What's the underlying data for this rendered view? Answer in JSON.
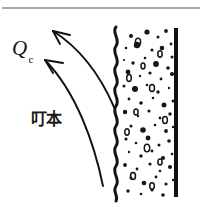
{
  "figure": {
    "background_color": "#ffffff",
    "ink_color": "#111111",
    "rule_color": "#8c8c8c",
    "width": 202,
    "height": 215,
    "top_rule": {
      "name": "top-horizontal-rule",
      "x1": 2,
      "y1": 8,
      "x2": 200,
      "y2": 8,
      "thickness": 1.6,
      "color": "#8c8c8c"
    },
    "labels": [
      {
        "name": "heat-flux-label",
        "base": "Q",
        "subscript": "c",
        "x": 12,
        "y": 36,
        "style": "italic-serif"
      },
      {
        "name": "material-annotation-label",
        "text": "叮本",
        "x": 31,
        "y": 104,
        "style": "bold-cjk"
      }
    ],
    "wall": {
      "name": "solid-wall-line",
      "x": 176,
      "y_top": 28,
      "y_bottom": 197,
      "thickness": 4,
      "color": "#111111"
    },
    "porous_boundary": {
      "name": "wavy-interface-line",
      "x_center": 116,
      "amplitude": 4.5,
      "wavelength": 20,
      "y_top": 27,
      "y_bottom": 201,
      "thickness": 3,
      "color": "#141414"
    },
    "arrows": [
      {
        "name": "upper-convection-arrow",
        "tail_x": 114,
        "tail_y": 107,
        "control_x": 100,
        "control_y": 66,
        "tip_x": 53,
        "tip_y": 31,
        "head_size": 13
      },
      {
        "name": "lower-convection-arrow",
        "tail_x": 103,
        "tail_y": 186,
        "control_x": 80,
        "control_y": 112,
        "tip_x": 45,
        "tip_y": 60,
        "head_size": 13
      }
    ],
    "speckles": {
      "name": "porous-material-speckles",
      "region": {
        "x_min": 122,
        "x_max": 174,
        "y_min": 30,
        "y_max": 198
      },
      "dots": [
        [
          131,
          36,
          2.0
        ],
        [
          147,
          32,
          2.6
        ],
        [
          158,
          37,
          1.5
        ],
        [
          166,
          31,
          1.9
        ],
        [
          171,
          44,
          1.4
        ],
        [
          126,
          48,
          1.3
        ],
        [
          137,
          45,
          3.2
        ],
        [
          152,
          50,
          1.6
        ],
        [
          162,
          48,
          2.3
        ],
        [
          172,
          57,
          1.5
        ],
        [
          124,
          60,
          1.1
        ],
        [
          133,
          63,
          1.7
        ],
        [
          145,
          58,
          1.3
        ],
        [
          156,
          64,
          2.9
        ],
        [
          168,
          68,
          1.8
        ],
        [
          128,
          72,
          2.4
        ],
        [
          140,
          76,
          1.2
        ],
        [
          150,
          73,
          1.6
        ],
        [
          161,
          79,
          1.4
        ],
        [
          172,
          74,
          2.1
        ],
        [
          124,
          86,
          1.5
        ],
        [
          135,
          89,
          3.0
        ],
        [
          147,
          85,
          1.3
        ],
        [
          158,
          92,
          1.7
        ],
        [
          169,
          88,
          1.2
        ],
        [
          129,
          99,
          1.4
        ],
        [
          141,
          103,
          1.8
        ],
        [
          153,
          98,
          1.3
        ],
        [
          164,
          105,
          2.5
        ],
        [
          173,
          101,
          1.5
        ],
        [
          125,
          112,
          2.2
        ],
        [
          138,
          116,
          1.2
        ],
        [
          149,
          111,
          1.6
        ],
        [
          160,
          118,
          1.4
        ],
        [
          170,
          114,
          1.7
        ],
        [
          131,
          126,
          1.5
        ],
        [
          143,
          130,
          2.8
        ],
        [
          155,
          125,
          1.3
        ],
        [
          166,
          131,
          1.9
        ],
        [
          173,
          127,
          1.2
        ],
        [
          126,
          139,
          1.6
        ],
        [
          136,
          143,
          1.3
        ],
        [
          148,
          138,
          2.4
        ],
        [
          159,
          145,
          1.5
        ],
        [
          169,
          141,
          1.8
        ],
        [
          129,
          152,
          1.2
        ],
        [
          141,
          156,
          1.7
        ],
        [
          152,
          151,
          1.4
        ],
        [
          163,
          158,
          2.1
        ],
        [
          172,
          154,
          1.3
        ],
        [
          125,
          165,
          1.9
        ],
        [
          137,
          169,
          1.4
        ],
        [
          150,
          164,
          1.6
        ],
        [
          160,
          171,
          1.3
        ],
        [
          170,
          167,
          2.0
        ],
        [
          131,
          178,
          1.5
        ],
        [
          144,
          183,
          2.3
        ],
        [
          156,
          177,
          1.4
        ],
        [
          166,
          184,
          1.6
        ],
        [
          173,
          180,
          1.2
        ],
        [
          128,
          191,
          1.7
        ],
        [
          141,
          194,
          1.3
        ],
        [
          152,
          190,
          1.5
        ],
        [
          163,
          195,
          1.8
        ]
      ],
      "rings": [
        [
          138,
          42,
          3.8,
          2.6
        ],
        [
          160,
          54,
          3.2,
          2.2
        ],
        [
          129,
          78,
          3.4,
          2.3
        ],
        [
          152,
          88,
          3.6,
          2.5
        ],
        [
          136,
          112,
          3.0,
          2.1
        ],
        [
          165,
          120,
          3.5,
          2.4
        ],
        [
          127,
          132,
          3.2,
          2.2
        ],
        [
          147,
          148,
          3.8,
          2.7
        ],
        [
          160,
          162,
          3.1,
          2.1
        ],
        [
          133,
          176,
          3.6,
          2.5
        ],
        [
          152,
          186,
          3.3,
          2.3
        ],
        [
          143,
          66,
          2.9,
          2.0
        ]
      ]
    }
  }
}
